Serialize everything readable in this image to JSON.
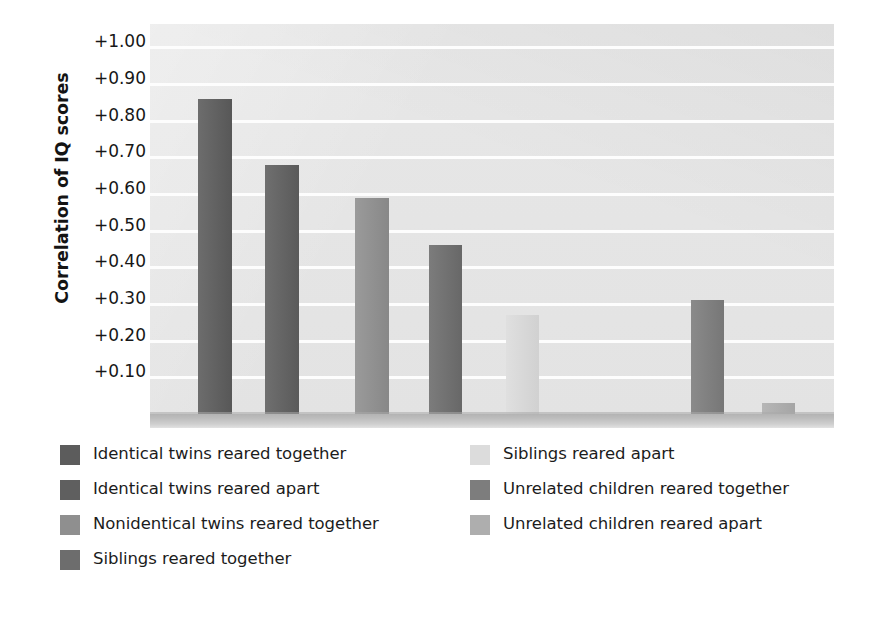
{
  "chart_data": {
    "type": "bar",
    "title": "",
    "subtitle": "",
    "xlabel": "",
    "ylabel": "Correlation of IQ scores",
    "ylim": [
      0.0,
      1.05
    ],
    "grid": true,
    "grid_axis": "y",
    "legend_position": "below-plot-two-columns",
    "ytick_labels": [
      "+1.00",
      "+0.90",
      "+0.80",
      "+0.70",
      "+0.60",
      "+0.50",
      "+0.40",
      "+0.30",
      "+0.20",
      "+0.10"
    ],
    "ytick_values": [
      1.0,
      0.9,
      0.8,
      0.7,
      0.6,
      0.5,
      0.4,
      0.3,
      0.2,
      0.1
    ],
    "categories": [
      "Identical twins reared together",
      "Identical twins reared apart",
      "Nonidentical twins reared together",
      "Siblings reared together",
      "Siblings reared apart",
      "Unrelated children reared together",
      "Unrelated children reared apart"
    ],
    "values": [
      0.86,
      0.68,
      0.59,
      0.46,
      0.27,
      0.31,
      0.03
    ],
    "colors": [
      "#5c5c5c",
      "#5f5f5f",
      "#8f8f8f",
      "#6d6d6d",
      "#dcdcdc",
      "#7d7d7d",
      "#aeaeae"
    ],
    "bar_px": [
      {
        "left": 198,
        "width": 34
      },
      {
        "left": 265,
        "width": 34
      },
      {
        "left": 355,
        "width": 34
      },
      {
        "left": 429,
        "width": 33
      },
      {
        "left": 506,
        "width": 33
      },
      {
        "left": 691,
        "width": 33
      },
      {
        "left": 762,
        "width": 33
      }
    ],
    "plot_bg": "#e4e4e4",
    "gridline_color": "#fdfdfd",
    "baseline_color": "#bdbdbd"
  },
  "legend": {
    "left_column": [
      {
        "label": "Identical twins reared together",
        "color": "#5c5c5c"
      },
      {
        "label": "Identical twins reared apart",
        "color": "#5f5f5f"
      },
      {
        "label": "Nonidentical twins reared together",
        "color": "#8f8f8f"
      },
      {
        "label": "Siblings reared together",
        "color": "#6d6d6d"
      }
    ],
    "right_column": [
      {
        "label": "Siblings reared apart",
        "color": "#dcdcdc"
      },
      {
        "label": "Unrelated children reared together",
        "color": "#7d7d7d"
      },
      {
        "label": "Unrelated children reared apart",
        "color": "#aeaeae"
      }
    ]
  }
}
